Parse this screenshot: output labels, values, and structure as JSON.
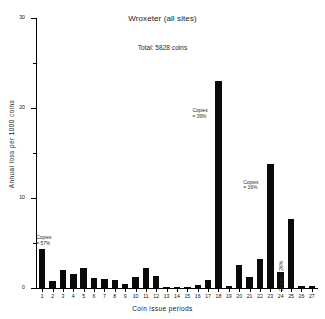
{
  "chart_data": {
    "type": "bar",
    "title": "Wroxeter (all sites)",
    "subtitle": "Total:  5828 coins",
    "xlabel": "Coin issue periods",
    "ylabel": "Annual loss per 1000 coins",
    "xlim": [
      0.4,
      27.6
    ],
    "ylim": [
      0,
      30
    ],
    "grid": false,
    "legend": "none",
    "categories": [
      "1",
      "2",
      "3",
      "4",
      "5",
      "6",
      "7",
      "8",
      "9",
      "10",
      "11",
      "12",
      "13",
      "14",
      "15",
      "16",
      "17",
      "18",
      "19",
      "20",
      "21",
      "22",
      "23",
      "24",
      "25",
      "26",
      "27"
    ],
    "values": [
      4.3,
      0.8,
      2.0,
      1.6,
      2.2,
      1.1,
      1.0,
      0.9,
      0.4,
      1.2,
      2.2,
      1.3,
      0.05,
      0.05,
      0.15,
      0.3,
      0.9,
      23.0,
      0.2,
      2.6,
      1.2,
      3.2,
      13.8,
      1.8,
      7.7,
      0.25,
      0.2
    ],
    "ytick_labels": [
      "0",
      "10",
      "20",
      "30"
    ],
    "ytick_values": [
      0,
      10,
      20,
      30
    ],
    "yminor_values": [
      5,
      15,
      25
    ],
    "annotations": [
      {
        "name": "copies-period-1",
        "text": "Copies\n=  57%",
        "x_period": 1,
        "value": 57,
        "orientation": "horizontal"
      },
      {
        "name": "copies-period-18",
        "text": "Copies\n=  39%",
        "x_period": 18,
        "value": 39,
        "orientation": "horizontal"
      },
      {
        "name": "copies-period-23",
        "text": "Copies\n=  16%",
        "x_period": 23,
        "value": 16,
        "orientation": "horizontal"
      },
      {
        "name": "copies-period-24",
        "text": "Copies =  26%",
        "x_period": 24,
        "value": 26,
        "orientation": "vertical"
      }
    ]
  },
  "colors": {
    "bar": "#0a0a0a",
    "axis": "#000000",
    "text": "#1a1a1a",
    "background": "#ffffff"
  }
}
